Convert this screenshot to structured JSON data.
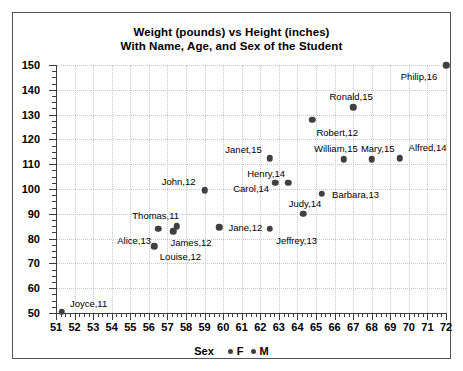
{
  "chart_data": {
    "type": "scatter",
    "title": "Weight (pounds) vs Height (inches)",
    "subtitle": "With Name, Age, and Sex of the Student",
    "xlabel": "",
    "ylabel": "",
    "xlim": [
      51,
      72
    ],
    "ylim": [
      50,
      150
    ],
    "xticks": [
      51,
      52,
      53,
      54,
      55,
      56,
      57,
      58,
      59,
      60,
      61,
      62,
      63,
      64,
      65,
      66,
      67,
      68,
      69,
      70,
      71,
      72
    ],
    "yticks": [
      50,
      60,
      70,
      80,
      90,
      100,
      110,
      120,
      130,
      140,
      150
    ],
    "y_minor_step": 2.5,
    "x_minor_step": 0.25,
    "grid": true,
    "legend": {
      "title": "Sex",
      "position": "bottom",
      "entries": [
        {
          "label": "F",
          "marker": "dot",
          "color": "#404040"
        },
        {
          "label": "M",
          "marker": "dot",
          "color": "#404040"
        }
      ]
    },
    "point_color": "#404040",
    "points": [
      {
        "name": "Joyce",
        "age": 11,
        "sex": "F",
        "x": 51.3,
        "y": 50.5,
        "label": "Joyce,11",
        "label_dx": 27,
        "label_dy": -9
      },
      {
        "name": "Alice",
        "age": 13,
        "sex": "F",
        "x": 56.5,
        "y": 84.0,
        "label": "Alice,13",
        "label_dx": -24,
        "label_dy": 11
      },
      {
        "name": "Thomas",
        "age": 11,
        "sex": "M",
        "x": 57.5,
        "y": 85.0,
        "label": "Thomas,11",
        "label_dx": -21,
        "label_dy": -11
      },
      {
        "name": "Louise",
        "age": 12,
        "sex": "F",
        "x": 56.3,
        "y": 77.0,
        "label": "Louise,12",
        "label_dx": 26,
        "label_dy": 10
      },
      {
        "name": "James",
        "age": 12,
        "sex": "M",
        "x": 57.3,
        "y": 83.0,
        "label": "James,12",
        "label_dx": 18,
        "label_dy": 11
      },
      {
        "name": "John",
        "age": 12,
        "sex": "M",
        "x": 59.0,
        "y": 99.5,
        "label": "John,12",
        "label_dx": -26,
        "label_dy": -9
      },
      {
        "name": "Jane",
        "age": 12,
        "sex": "F",
        "x": 59.8,
        "y": 84.5,
        "label": "Jane,12",
        "label_dx": 26,
        "label_dy": 0
      },
      {
        "name": "Janet",
        "age": 15,
        "sex": "F",
        "x": 62.5,
        "y": 112.5,
        "label": "Janet,15",
        "label_dx": -26,
        "label_dy": -9
      },
      {
        "name": "Henry",
        "age": 14,
        "sex": "M",
        "x": 63.5,
        "y": 102.5,
        "label": "Henry,14",
        "label_dx": -22,
        "label_dy": -10
      },
      {
        "name": "Carol",
        "age": 14,
        "sex": "F",
        "x": 62.8,
        "y": 102.5,
        "label": "Carol,14",
        "label_dx": -24,
        "label_dy": 5
      },
      {
        "name": "Jeffrey",
        "age": 13,
        "sex": "M",
        "x": 62.5,
        "y": 84.0,
        "label": "Jeffrey,13",
        "label_dx": 27,
        "label_dy": 11
      },
      {
        "name": "Judy",
        "age": 14,
        "sex": "F",
        "x": 64.3,
        "y": 90.0,
        "label": "Judy,14",
        "label_dx": 2,
        "label_dy": -11
      },
      {
        "name": "Barbara",
        "age": 13,
        "sex": "F",
        "x": 65.3,
        "y": 98.0,
        "label": "Barbara,13",
        "label_dx": 34,
        "label_dy": 0
      },
      {
        "name": "Robert",
        "age": 12,
        "sex": "M",
        "x": 64.8,
        "y": 128.0,
        "label": "Robert,12",
        "label_dx": 25,
        "label_dy": 12
      },
      {
        "name": "William",
        "age": 15,
        "sex": "M",
        "x": 66.5,
        "y": 112.0,
        "label": "William,15",
        "label_dx": -8,
        "label_dy": -11
      },
      {
        "name": "Ronald",
        "age": 15,
        "sex": "M",
        "x": 67.0,
        "y": 133.0,
        "label": "Ronald,15",
        "label_dx": -2,
        "label_dy": -11
      },
      {
        "name": "Mary",
        "age": 15,
        "sex": "F",
        "x": 68.0,
        "y": 112.0,
        "label": "Mary,15",
        "label_dx": 6,
        "label_dy": -11
      },
      {
        "name": "Alfred",
        "age": 14,
        "sex": "M",
        "x": 69.5,
        "y": 112.5,
        "label": "Alfred,14",
        "label_dx": 28,
        "label_dy": -11
      },
      {
        "name": "Philip",
        "age": 16,
        "sex": "M",
        "x": 72.0,
        "y": 150.0,
        "label": "Philip,16",
        "label_dx": -27,
        "label_dy": 11
      }
    ]
  }
}
